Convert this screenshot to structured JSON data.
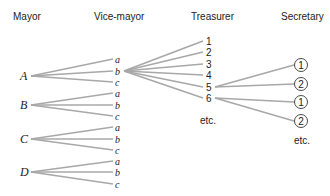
{
  "headers": {
    "mayor": "Mayor",
    "vice_mayor": "Vice-mayor",
    "treasurer": "Treasurer",
    "secretary": "Secretary"
  },
  "mayors": [
    {
      "label": "A",
      "y": 76,
      "vice": [
        {
          "label": "a",
          "y": 59
        },
        {
          "label": "b",
          "y": 71
        },
        {
          "label": "c",
          "y": 82
        }
      ]
    },
    {
      "label": "B",
      "y": 105,
      "vice": [
        {
          "label": "a",
          "y": 93
        },
        {
          "label": "b",
          "y": 105
        },
        {
          "label": "c",
          "y": 116
        }
      ]
    },
    {
      "label": "C",
      "y": 139,
      "vice": [
        {
          "label": "a",
          "y": 127
        },
        {
          "label": "b",
          "y": 139
        },
        {
          "label": "c",
          "y": 150
        }
      ]
    },
    {
      "label": "D",
      "y": 172,
      "vice": [
        {
          "label": "a",
          "y": 161
        },
        {
          "label": "b",
          "y": 172
        },
        {
          "label": "c",
          "y": 184
        }
      ]
    }
  ],
  "treasurer": {
    "from": {
      "mayor": "A",
      "vice": "b"
    },
    "items": [
      {
        "label": "1",
        "y": 41
      },
      {
        "label": "2",
        "y": 52
      },
      {
        "label": "3",
        "y": 64
      },
      {
        "label": "4",
        "y": 75
      },
      {
        "label": "5",
        "y": 87
      },
      {
        "label": "6",
        "y": 98
      }
    ],
    "etc": "etc."
  },
  "secretary": {
    "groups": [
      {
        "from": "5",
        "items": [
          {
            "label": "1",
            "y": 65
          },
          {
            "label": "2",
            "y": 84
          }
        ]
      },
      {
        "from": "6",
        "items": [
          {
            "label": "1",
            "y": 102
          },
          {
            "label": "2",
            "y": 121
          }
        ]
      }
    ],
    "etc": "etc."
  }
}
